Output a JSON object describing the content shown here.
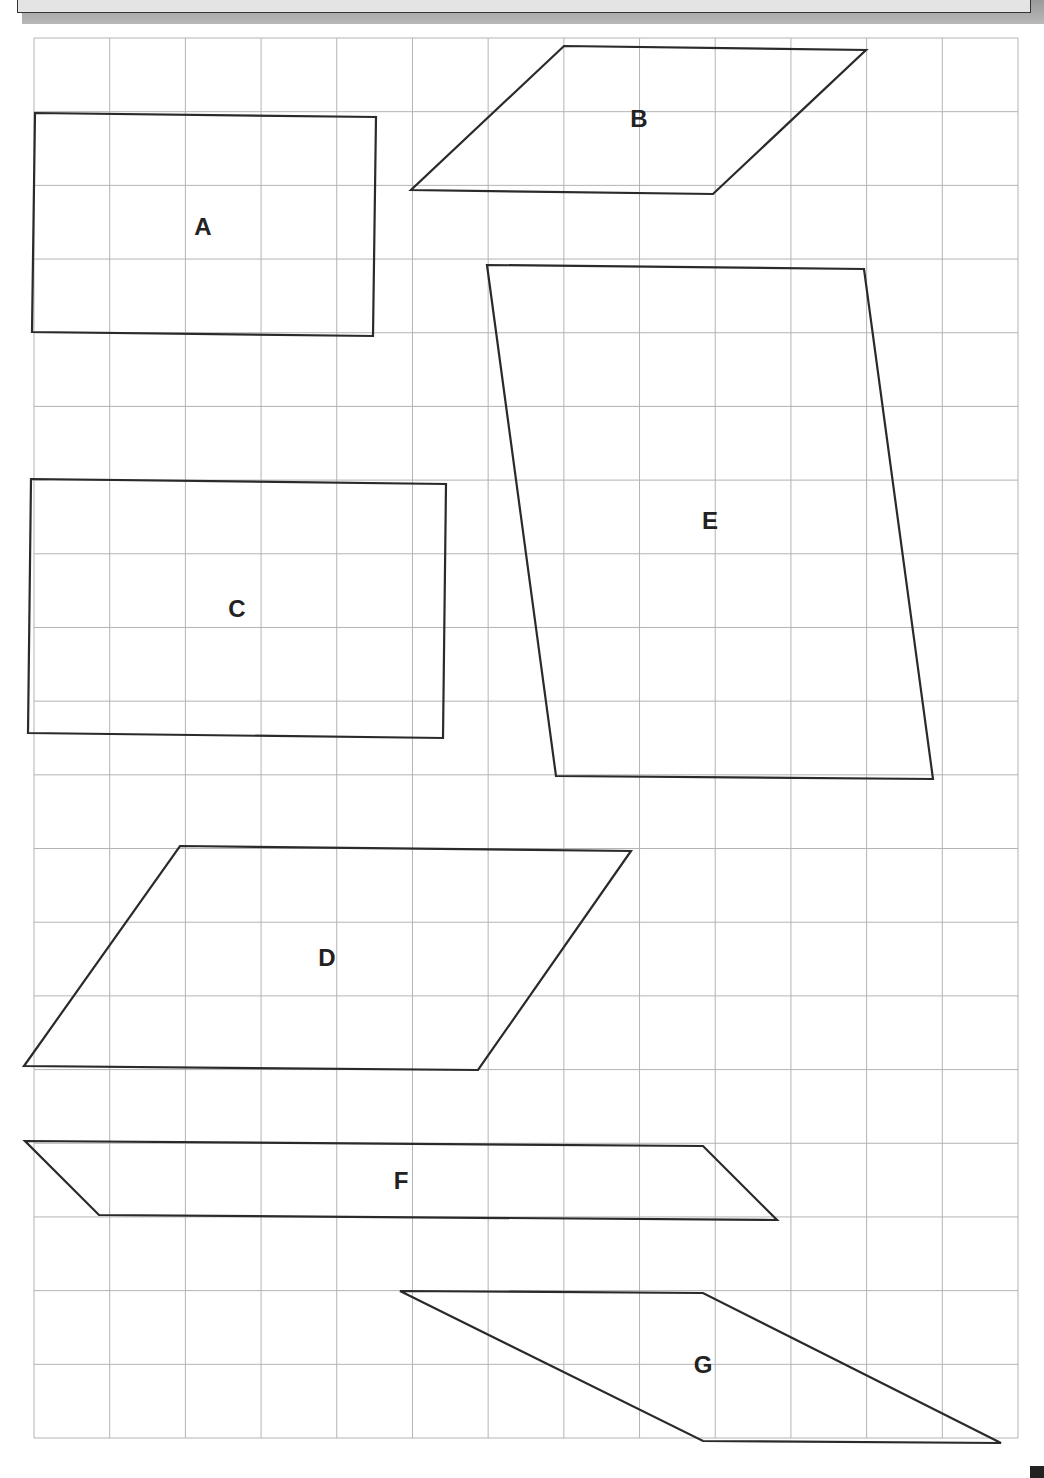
{
  "page": {
    "width": 1044,
    "height": 1478
  },
  "grid": {
    "left": 34,
    "top": 38,
    "right": 1018,
    "bottom": 1438,
    "columns": 13,
    "rows": 19,
    "line_color": "#b3b3b3"
  },
  "shapes": [
    {
      "id": "A",
      "label": "A",
      "points": [
        [
          35,
          113
        ],
        [
          376,
          117
        ],
        [
          373,
          336
        ],
        [
          32,
          332
        ]
      ],
      "label_pos": [
        203,
        226
      ]
    },
    {
      "id": "B",
      "label": "B",
      "points": [
        [
          564,
          46
        ],
        [
          866,
          50
        ],
        [
          713,
          194
        ],
        [
          411,
          190
        ]
      ],
      "label_pos": [
        639,
        118
      ]
    },
    {
      "id": "C",
      "label": "C",
      "points": [
        [
          31,
          479
        ],
        [
          446,
          484
        ],
        [
          443,
          738
        ],
        [
          28,
          733
        ]
      ],
      "label_pos": [
        237,
        608
      ]
    },
    {
      "id": "E",
      "label": "E",
      "points": [
        [
          487,
          265
        ],
        [
          864,
          269
        ],
        [
          933,
          779
        ],
        [
          556,
          776
        ]
      ],
      "label_pos": [
        710,
        520
      ]
    },
    {
      "id": "D",
      "label": "D",
      "points": [
        [
          180,
          846
        ],
        [
          631,
          851
        ],
        [
          478,
          1070
        ],
        [
          24,
          1066
        ]
      ],
      "label_pos": [
        327,
        957
      ]
    },
    {
      "id": "F",
      "label": "F",
      "points": [
        [
          25,
          1141
        ],
        [
          703,
          1146
        ],
        [
          777,
          1220
        ],
        [
          99,
          1215
        ]
      ],
      "label_pos": [
        401,
        1180
      ]
    },
    {
      "id": "G",
      "label": "G",
      "points": [
        [
          400,
          1291
        ],
        [
          703,
          1293
        ],
        [
          1001,
          1443
        ],
        [
          703,
          1441
        ]
      ],
      "label_pos": [
        703,
        1364
      ]
    }
  ],
  "colors": {
    "outline": "#2a2a2a",
    "label": "#222222",
    "header_fill": "#e4e4e4",
    "header_shadow": "#a8a8a8"
  }
}
